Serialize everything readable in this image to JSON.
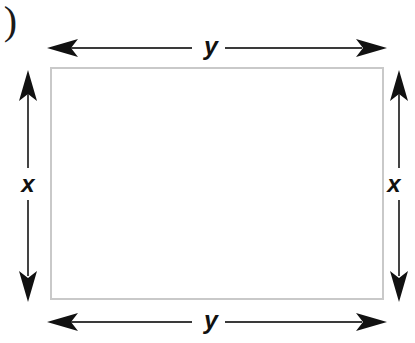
{
  "figure": {
    "kind": "geometry-diagram",
    "width_px": 415,
    "height_px": 343,
    "background_color": "#ffffff",
    "part_marker": ")"
  },
  "shape": {
    "name": "rectangle",
    "border_color": "#c9c9c9",
    "fill_color": "#ffffff",
    "border_width_px": 2
  },
  "labels": {
    "top": "y",
    "bottom": "y",
    "left": "x",
    "right": "x"
  },
  "dimension_arrows": [
    {
      "name": "top-width-arrow",
      "orientation": "horizontal",
      "label": "y",
      "double_headed": true,
      "color": "#1a1a1a"
    },
    {
      "name": "bottom-width-arrow",
      "orientation": "horizontal",
      "label": "y",
      "double_headed": true,
      "color": "#1a1a1a"
    },
    {
      "name": "left-height-arrow",
      "orientation": "vertical",
      "label": "x",
      "double_headed": true,
      "color": "#1a1a1a"
    },
    {
      "name": "right-height-arrow",
      "orientation": "vertical",
      "label": "x",
      "double_headed": true,
      "color": "#1a1a1a"
    }
  ],
  "colors": {
    "line": "#1a1a1a",
    "rule": "#444444",
    "rectangle_stroke": "#c9c9c9",
    "background": "#ffffff"
  }
}
